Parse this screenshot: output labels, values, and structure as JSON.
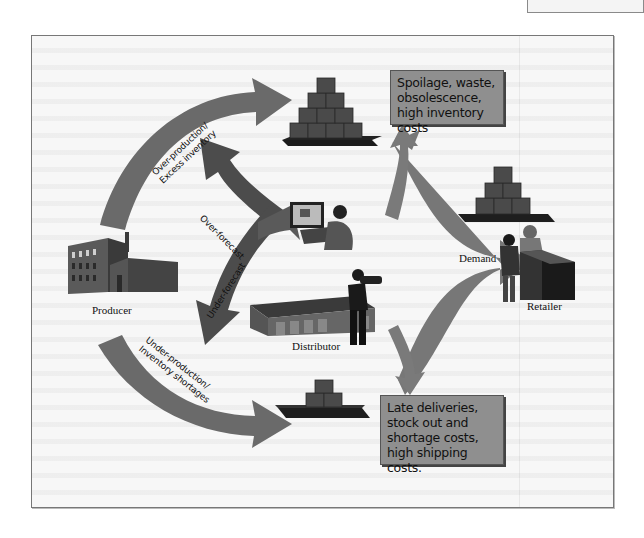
{
  "diagram": {
    "nodes": {
      "producer": "Producer",
      "distributor": "Distributor",
      "retailer": "Retailer",
      "demand": "Demand"
    },
    "arrows": {
      "over_production_line1": "Over-production/",
      "over_production_line2": "Excess inventory",
      "over_forecast": "Over-forecast",
      "under_forecast": "Under-forecast",
      "under_production_line1": "Under-production/",
      "under_production_line2": "Inventory shortages"
    },
    "callouts": {
      "excess": "Spoilage, waste, obsolescence, high inventory costs",
      "shortage": "Late deliveries, stock out and shortage costs, high shipping costs."
    },
    "colors": {
      "arrow": "#6e6e6e",
      "arrow_dark": "#3c3c3c",
      "callout_bg": "#8f8f8f",
      "box_fill": "#4a4a4a",
      "frame_bg": "#f7f7f7"
    }
  }
}
